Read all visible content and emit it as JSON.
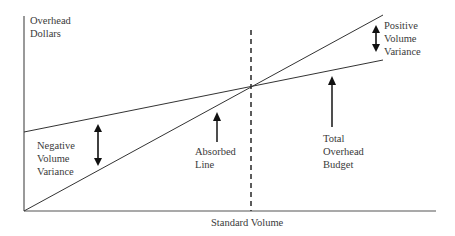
{
  "diagram": {
    "y_axis_label": [
      "Overhead",
      "Dollars"
    ],
    "x_axis_label": "Standard Volume",
    "annotations": {
      "negative_variance": [
        "Negative",
        "Volume",
        "Variance"
      ],
      "absorbed_line": [
        "Absorbed",
        "Line"
      ],
      "total_budget": [
        "Total",
        "Overhead",
        "Budget"
      ],
      "positive_variance": [
        "Positive",
        "Volume",
        "Variance"
      ]
    },
    "lines": [
      {
        "name": "Total Overhead Budget",
        "from": [
          24,
          132
        ],
        "to": [
          383,
          60
        ],
        "style": "solid"
      },
      {
        "name": "Absorbed Line",
        "from": [
          24,
          211
        ],
        "to": [
          383,
          15
        ],
        "style": "solid"
      },
      {
        "name": "Standard Volume marker",
        "from": [
          251,
          30
        ],
        "to": [
          251,
          211
        ],
        "style": "dashed"
      }
    ],
    "colors": {
      "line": "#333333",
      "text": "#3a3a3a",
      "background": "#ffffff"
    }
  }
}
